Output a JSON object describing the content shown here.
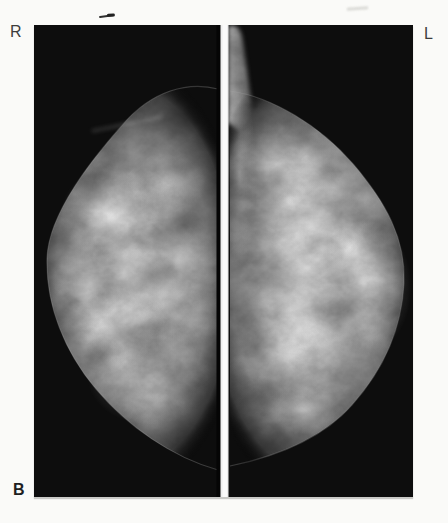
{
  "figure": {
    "labels": {
      "right_marker": "R",
      "left_marker": "L",
      "panel_marker": "B"
    }
  },
  "colors": {
    "page_background": "#fafaf8",
    "film_black": "#0d0d0d",
    "tissue_gray_center": "#b2b2b2",
    "tissue_gray_edge": "#3a3a3a",
    "divider_line": "#f2f2f2",
    "marker_text": "#3c3c3c",
    "panel_text": "#1f1f1f"
  }
}
